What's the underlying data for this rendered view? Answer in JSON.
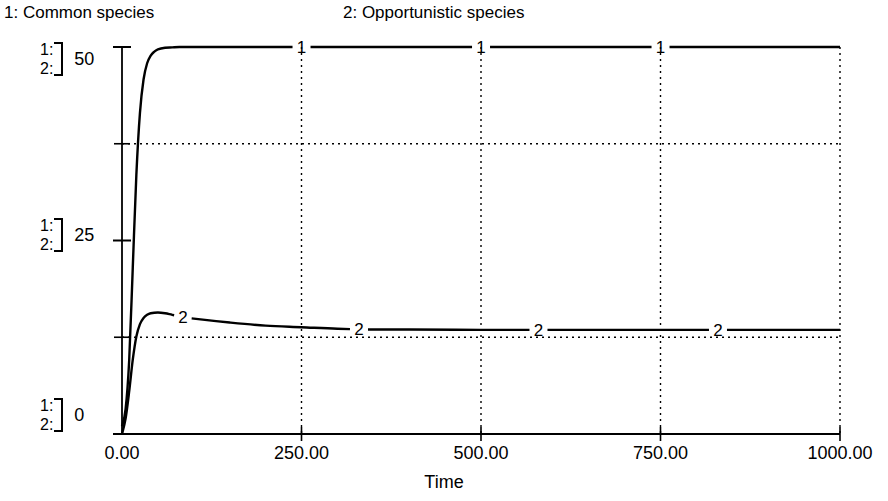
{
  "legend": {
    "series1": "1: Common species",
    "series2": "2: Opportunistic species"
  },
  "y_axis": {
    "groups": [
      {
        "line1": "1:",
        "line2": "2:",
        "value": "50"
      },
      {
        "line1": "1:",
        "line2": "2:",
        "value": "25"
      },
      {
        "line1": "1:",
        "line2": "2:",
        "value": "0"
      }
    ]
  },
  "x_axis": {
    "title": "Time",
    "ticks": [
      "0.00",
      "250.00",
      "500.00",
      "750.00",
      "1000.00"
    ]
  },
  "markers": {
    "series1": [
      "1",
      "1",
      "1"
    ],
    "series2": [
      "2",
      "2",
      "2",
      "2"
    ]
  },
  "colors": {
    "line": "#000000",
    "grid": "#000000",
    "axis": "#000000",
    "background": "#ffffff"
  },
  "chart_data": {
    "type": "line",
    "title": "",
    "subtitle": "",
    "xlabel": "Time",
    "ylabel": "",
    "xlim": [
      0,
      1000
    ],
    "ylim": [
      0,
      50
    ],
    "grid": true,
    "grid_style": "dotted",
    "x_ticks": [
      0,
      250,
      500,
      750,
      1000
    ],
    "x_tick_labels": [
      "0.00",
      "250.00",
      "500.00",
      "750.00",
      "1000.00"
    ],
    "y_ticks": [
      0,
      25,
      50
    ],
    "y_tick_labels": [
      "0",
      "25",
      "50"
    ],
    "y_gridlines": [
      12.5,
      37.5
    ],
    "legend_position": "top",
    "series": [
      {
        "name": "1: Common species",
        "marker_label": "1",
        "marker_x": [
          250,
          500,
          750
        ],
        "x": [
          0,
          5,
          10,
          15,
          20,
          25,
          30,
          35,
          40,
          45,
          50,
          60,
          70,
          80,
          100,
          150,
          200,
          250,
          300,
          400,
          500,
          600,
          700,
          800,
          900,
          1000
        ],
        "values": [
          1,
          3.2,
          9.5,
          21.5,
          33.5,
          41.5,
          45.8,
          47.9,
          48.9,
          49.4,
          49.7,
          49.9,
          49.95,
          50,
          50,
          50,
          50,
          50,
          50,
          50,
          50,
          50,
          50,
          50,
          50,
          50
        ]
      },
      {
        "name": "2: Opportunistic species",
        "marker_label": "2",
        "marker_x": [
          85,
          330,
          580,
          830
        ],
        "x": [
          0,
          5,
          10,
          15,
          20,
          25,
          30,
          35,
          40,
          50,
          60,
          70,
          85,
          100,
          150,
          200,
          250,
          300,
          350,
          400,
          500,
          600,
          700,
          800,
          900,
          1000
        ],
        "values": [
          0,
          2.0,
          5.5,
          9.6,
          12.6,
          14.2,
          15.0,
          15.4,
          15.6,
          15.7,
          15.6,
          15.4,
          15.1,
          14.9,
          14.4,
          14.0,
          13.8,
          13.6,
          13.5,
          13.5,
          13.45,
          13.45,
          13.45,
          13.45,
          13.45,
          13.45
        ]
      }
    ]
  }
}
